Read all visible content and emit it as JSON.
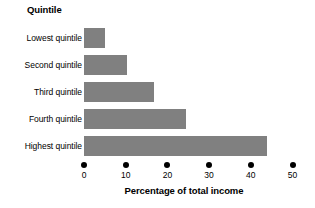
{
  "chart_data": {
    "type": "bar",
    "orientation": "horizontal",
    "title": "Quintile",
    "xlabel": "Percentage of total income",
    "ylabel": "Quintile",
    "categories": [
      "Lowest quintile",
      "Second quintile",
      "Third quintile",
      "Fourth quintile",
      "Highest quintile"
    ],
    "values": [
      5.0,
      10.3,
      16.8,
      24.5,
      44.0
    ],
    "xlim": [
      0,
      50
    ],
    "xticks": [
      0,
      10,
      20,
      30,
      40,
      50
    ],
    "xtick_labels": [
      "0",
      "10",
      "20",
      "30",
      "40",
      "50"
    ],
    "grid": false,
    "legend": null,
    "bar_color": "#808080",
    "axis_color": "#000000",
    "background": "#ffffff"
  }
}
